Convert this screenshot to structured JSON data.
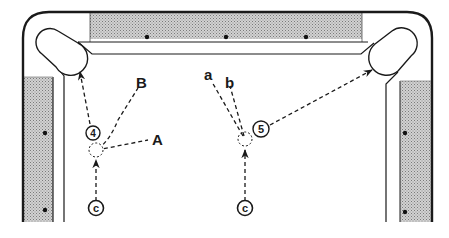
{
  "diagram": {
    "colors": {
      "line": "#1a1a1a",
      "rail_shade": "#b9b9b9",
      "background": "#ffffff"
    },
    "labels": {
      "A": "A",
      "B": "B",
      "a": "a",
      "b": "b"
    },
    "balls": [
      {
        "id": "ball-4",
        "label": "4",
        "cx": 93,
        "cy": 133
      },
      {
        "id": "ball-5",
        "label": "5",
        "cx": 261,
        "cy": 129
      },
      {
        "id": "cue-ball-left",
        "label": "c",
        "cx": 96,
        "cy": 208
      },
      {
        "id": "cue-ball-right",
        "label": "c",
        "cx": 245,
        "cy": 208
      }
    ],
    "ghost_balls": [
      {
        "id": "ghost-left",
        "cx": 96,
        "cy": 150
      },
      {
        "id": "ghost-right",
        "cx": 245,
        "cy": 139
      }
    ]
  }
}
